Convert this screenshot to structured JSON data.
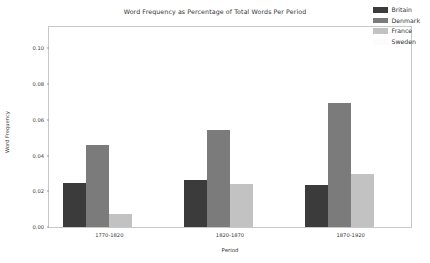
{
  "chart_data": {
    "type": "bar",
    "title": "Word Frequency as Percentage of Total Words Per Period",
    "xlabel": "Period",
    "ylabel": "Word Frequency",
    "categories": [
      "1770-1820",
      "1820-1870",
      "1870-1920"
    ],
    "series": [
      {
        "name": "Britain",
        "color": "#3b3b3b",
        "values": [
          0.0245,
          0.0262,
          0.0234
        ]
      },
      {
        "name": "Denmark",
        "color": "#7b7b7b",
        "values": [
          0.0458,
          0.0543,
          0.0697
        ]
      },
      {
        "name": "France",
        "color": "#c2c2c2",
        "values": [
          0.0074,
          0.0242,
          0.0298
        ]
      },
      {
        "name": "Sweden",
        "color": "#fcfcfc",
        "values": [
          0.0,
          0.0,
          0.0
        ]
      }
    ],
    "ylim": [
      0.0,
      0.112
    ],
    "yticks": [
      "0.00",
      "0.02",
      "0.04",
      "0.06",
      "0.08",
      "0.10"
    ],
    "ytick_values": [
      0.0,
      0.02,
      0.04,
      0.06,
      0.08,
      0.1
    ],
    "grid": false,
    "legend_position": "upper right"
  }
}
